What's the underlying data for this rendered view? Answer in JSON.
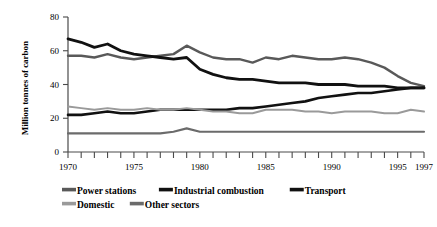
{
  "chart_data": {
    "type": "line",
    "title": "",
    "xlabel": "",
    "ylabel": "Million tonnes of carbon",
    "xlim": [
      1970,
      1997
    ],
    "ylim": [
      0,
      80
    ],
    "yticks": [
      0,
      20,
      40,
      60,
      80
    ],
    "ytick_labels": [
      "0",
      "20",
      "40",
      "60",
      "80"
    ],
    "xticks": [
      1970,
      1971,
      1972,
      1973,
      1974,
      1975,
      1976,
      1977,
      1978,
      1979,
      1980,
      1981,
      1982,
      1983,
      1984,
      1985,
      1986,
      1987,
      1988,
      1989,
      1990,
      1991,
      1992,
      1993,
      1994,
      1995,
      1996,
      1997
    ],
    "xtick_labels_shown": [
      "1970",
      "1975",
      "1980",
      "1985",
      "1990",
      "1995",
      "1997"
    ],
    "grid": false,
    "legend_position": "bottom",
    "x": [
      1970,
      1971,
      1972,
      1973,
      1974,
      1975,
      1976,
      1977,
      1978,
      1979,
      1980,
      1981,
      1982,
      1983,
      1984,
      1985,
      1986,
      1987,
      1988,
      1989,
      1990,
      1991,
      1992,
      1993,
      1994,
      1995,
      1996,
      1997
    ],
    "series": [
      {
        "name": "Power stations",
        "color": "#595959",
        "width": 2.4,
        "values": [
          57,
          57,
          56,
          58,
          56,
          55,
          56,
          57,
          58,
          63,
          59,
          56,
          55,
          55,
          53,
          56,
          55,
          57,
          56,
          55,
          55,
          56,
          55,
          53,
          50,
          45,
          41,
          39
        ]
      },
      {
        "name": "Industrial combustion",
        "color": "#111111",
        "width": 2.8,
        "values": [
          67,
          65,
          62,
          64,
          60,
          58,
          57,
          56,
          55,
          56,
          49,
          46,
          44,
          43,
          43,
          42,
          41,
          41,
          41,
          40,
          40,
          40,
          39,
          39,
          39,
          38,
          38,
          38
        ]
      },
      {
        "name": "Transport",
        "color": "#111111",
        "width": 2.6,
        "values": [
          22,
          22,
          23,
          24,
          23,
          23,
          24,
          25,
          25,
          25,
          25,
          25,
          25,
          26,
          26,
          27,
          28,
          29,
          30,
          32,
          33,
          34,
          35,
          35,
          36,
          37,
          38,
          38
        ]
      },
      {
        "name": "Domestic",
        "color": "#9a9a9a",
        "width": 2.0,
        "values": [
          27,
          26,
          25,
          26,
          25,
          25,
          26,
          25,
          25,
          26,
          25,
          24,
          24,
          23,
          23,
          25,
          25,
          25,
          24,
          24,
          23,
          24,
          24,
          24,
          23,
          23,
          25,
          24
        ]
      },
      {
        "name": "Other sectors",
        "color": "#6b6b6b",
        "width": 2.2,
        "values": [
          11,
          11,
          11,
          11,
          11,
          11,
          11,
          11,
          12,
          14,
          12,
          12,
          12,
          12,
          12,
          12,
          12,
          12,
          12,
          12,
          12,
          12,
          12,
          12,
          12,
          12,
          12,
          12
        ]
      }
    ]
  },
  "legend": {
    "row1": [
      {
        "label": "Power stations",
        "color": "#595959"
      },
      {
        "label": "Industrial combustion",
        "color": "#111111"
      },
      {
        "label": "Transport",
        "color": "#111111"
      }
    ],
    "row2": [
      {
        "label": "Domestic",
        "color": "#9a9a9a"
      },
      {
        "label": "Other sectors",
        "color": "#6b6b6b"
      }
    ]
  }
}
